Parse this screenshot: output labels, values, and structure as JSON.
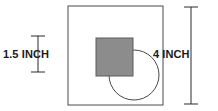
{
  "figure": {
    "background_color": "#ffffff",
    "canvas": {
      "width": 218,
      "height": 111
    },
    "shapes": {
      "outer_square": {
        "name": "outer-square",
        "x": 68,
        "y": 6,
        "width": 95,
        "height": 99,
        "fill": "none",
        "stroke": "#4a4a4a",
        "stroke_width": 1
      },
      "shaded_square": {
        "name": "shaded-square",
        "x": 96,
        "y": 38,
        "width": 37,
        "height": 38,
        "fill": "#8c8c8c",
        "stroke": "#5c5c5c",
        "stroke_width": 1
      },
      "circle": {
        "name": "circle",
        "cx": 134,
        "cy": 75,
        "r": 25,
        "fill": "none",
        "stroke": "#4a4a4a",
        "stroke_width": 1
      }
    },
    "dimensions": {
      "left": {
        "label": "1.5 INCH",
        "line_x": 38,
        "line_y1": 36,
        "line_y2": 72,
        "tick_half_width": 7,
        "stroke": "#2b2b2b",
        "stroke_width": 1
      },
      "right": {
        "label": "4 INCH",
        "line_x": 191,
        "line_y1": 7,
        "line_y2": 104,
        "tick_half_width": 7,
        "stroke": "#2b2b2b",
        "stroke_width": 1
      }
    }
  }
}
